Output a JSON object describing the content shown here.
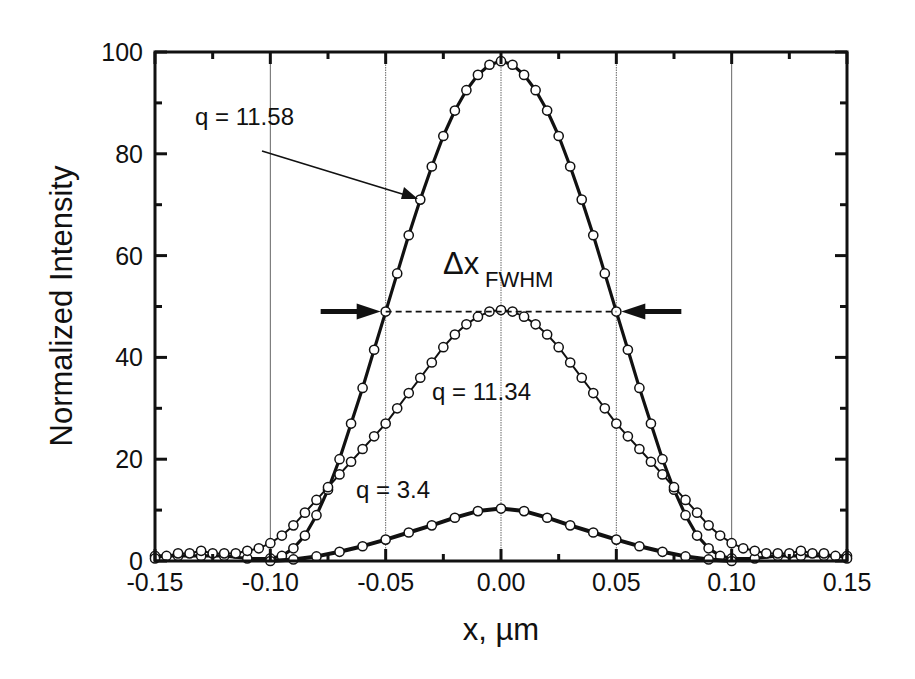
{
  "chart_data": {
    "type": "line",
    "title": "",
    "xlabel": "x, µm",
    "ylabel": "Normalized Intensity",
    "xlim": [
      -0.15,
      0.15
    ],
    "ylim": [
      0,
      100
    ],
    "x_ticks": [
      "-0.15",
      "-0.10",
      "-0.05",
      "0.00",
      "0.05",
      "0.10",
      "0.15"
    ],
    "y_ticks": [
      "0",
      "20",
      "40",
      "60",
      "80",
      "100"
    ],
    "grid": "vertical lines at x = -0.10, -0.05, 0.00, 0.05, 0.10",
    "legend": "none (curves labeled by annotations)",
    "series": [
      {
        "name": "q = 11.58",
        "style": "thick line with open circle markers",
        "x": [
          -0.15,
          -0.14,
          -0.13,
          -0.12,
          -0.11,
          -0.1,
          -0.095,
          -0.09,
          -0.085,
          -0.08,
          -0.075,
          -0.07,
          -0.065,
          -0.06,
          -0.055,
          -0.05,
          -0.045,
          -0.04,
          -0.035,
          -0.03,
          -0.025,
          -0.02,
          -0.015,
          -0.01,
          -0.005,
          0.0,
          0.005,
          0.01,
          0.015,
          0.02,
          0.025,
          0.03,
          0.035,
          0.04,
          0.045,
          0.05,
          0.055,
          0.06,
          0.065,
          0.07,
          0.075,
          0.08,
          0.085,
          0.09,
          0.095,
          0.1,
          0.11,
          0.12,
          0.13,
          0.14,
          0.15
        ],
        "y": [
          1,
          1,
          1,
          1,
          0.5,
          0.5,
          1,
          2.5,
          5,
          9,
          14,
          20,
          27,
          34,
          41.5,
          49,
          56.5,
          64,
          71,
          77.5,
          83.5,
          88.5,
          92.5,
          95.5,
          97.5,
          98.2,
          97.5,
          95.5,
          92.5,
          88.5,
          83.5,
          77.5,
          71,
          64,
          56.5,
          49,
          41.5,
          34,
          27,
          20,
          14,
          9,
          5,
          2.5,
          1,
          0.5,
          0.5,
          1,
          1,
          1,
          1
        ]
      },
      {
        "name": "q = 11.34",
        "style": "thin line with open circle markers",
        "x": [
          -0.15,
          -0.145,
          -0.14,
          -0.135,
          -0.13,
          -0.125,
          -0.12,
          -0.115,
          -0.11,
          -0.105,
          -0.1,
          -0.095,
          -0.09,
          -0.085,
          -0.08,
          -0.075,
          -0.07,
          -0.065,
          -0.06,
          -0.055,
          -0.05,
          -0.045,
          -0.04,
          -0.035,
          -0.03,
          -0.025,
          -0.02,
          -0.015,
          -0.01,
          -0.005,
          0.0,
          0.005,
          0.01,
          0.015,
          0.02,
          0.025,
          0.03,
          0.035,
          0.04,
          0.045,
          0.05,
          0.055,
          0.06,
          0.065,
          0.07,
          0.075,
          0.08,
          0.085,
          0.09,
          0.095,
          0.1,
          0.105,
          0.11,
          0.115,
          0.12,
          0.125,
          0.13,
          0.135,
          0.14,
          0.145,
          0.15
        ],
        "y": [
          0.5,
          1,
          1.5,
          1.5,
          2,
          1.5,
          1.5,
          1.5,
          2,
          2.5,
          3.5,
          5,
          7,
          9.5,
          12,
          14.5,
          17,
          19.5,
          22,
          24.5,
          27,
          30,
          33,
          36,
          39,
          42,
          44.5,
          46.5,
          48,
          49,
          49.3,
          49,
          48,
          46.5,
          44.5,
          42,
          39,
          36,
          33,
          30,
          27,
          24.5,
          22,
          19.5,
          17,
          14.5,
          12,
          9.5,
          7,
          5,
          3.5,
          2.5,
          2,
          1.5,
          1.5,
          1.5,
          2,
          1.5,
          1.5,
          1,
          0.5
        ]
      },
      {
        "name": "q = 3.4",
        "style": "thick solid line, no markers",
        "x": [
          -0.1,
          -0.09,
          -0.08,
          -0.07,
          -0.06,
          -0.05,
          -0.04,
          -0.03,
          -0.02,
          -0.01,
          0.0,
          0.01,
          0.02,
          0.03,
          0.04,
          0.05,
          0.06,
          0.07,
          0.08,
          0.09,
          0.1
        ],
        "y": [
          0,
          0.3,
          0.9,
          1.8,
          2.9,
          4.2,
          5.6,
          7.0,
          8.5,
          9.8,
          10.3,
          9.8,
          8.5,
          7.0,
          5.6,
          4.2,
          2.9,
          1.8,
          0.9,
          0.3,
          0
        ]
      }
    ],
    "annotations": [
      {
        "text": "q = 11.58",
        "target": "q = 11.58 curve",
        "arrow": true
      },
      {
        "text": "q = 11.34",
        "target": "q = 11.34 curve"
      },
      {
        "text": "q = 3.4",
        "target": "q = 3.4 curve"
      },
      {
        "text": "Δx",
        "subscript": "FWHM",
        "description": "full width at half maximum marked by dashed line at y = 49 between x = -0.05 and x = 0.05 with inward-pointing arrows"
      }
    ]
  }
}
